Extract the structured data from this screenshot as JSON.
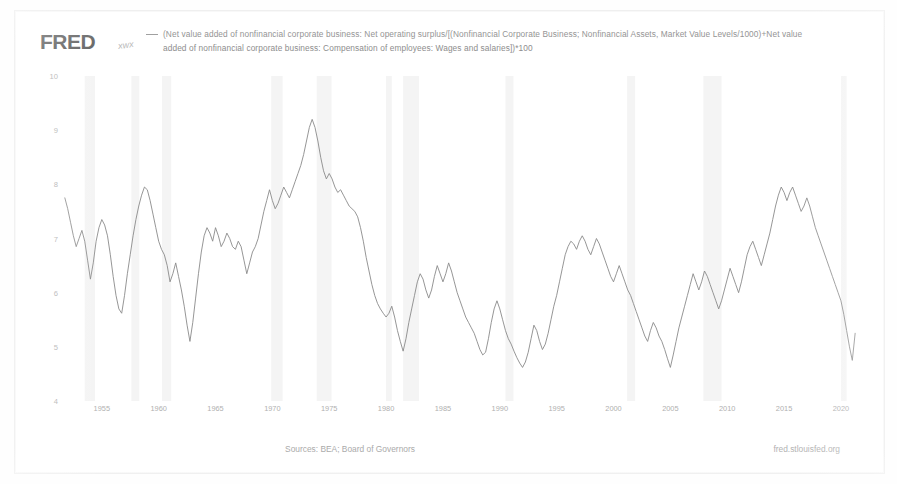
{
  "header": {
    "logo": "FRED",
    "logo_mark": "icon",
    "legend_text": "(Net value added of nonfinancial corporate business: Net operating surplus/[(Nonfinancial Corporate Business; Nonfinancial Assets, Market Value Levels/1000)+Net value added of nonfinancial corporate business: Compensation of employees: Wages and salaries])*100"
  },
  "footer": {
    "sources": "Sources: BEA; Board of Governors",
    "url": "fred.stlouisfed.org"
  },
  "style": {
    "line_color": "#8a8a8a",
    "recession_color": "#f4f4f4",
    "tick_color": "#b0b0b0",
    "text_color": "#8d8d8d",
    "background": "#ffffff"
  },
  "chart_data": {
    "type": "line",
    "title": "",
    "subtitle": "",
    "xlabel": "",
    "ylabel": "",
    "xlim": [
      1951.5,
      2021.5
    ],
    "ylim": [
      4,
      10
    ],
    "yticks": [
      4,
      5,
      6,
      7,
      8,
      9,
      10
    ],
    "xticks": [
      1955,
      1960,
      1965,
      1970,
      1975,
      1980,
      1985,
      1990,
      1995,
      2000,
      2005,
      2010,
      2015,
      2020
    ],
    "xtick_labels": [
      "1955",
      "1960",
      "1965",
      "1970",
      "1975",
      "1980",
      "1985",
      "1990",
      "1995",
      "2000",
      "2005",
      "2010",
      "2015",
      "2020"
    ],
    "ytick_labels": [
      "4",
      "5",
      "6",
      "7",
      "8",
      "9",
      "10"
    ],
    "grid": false,
    "legend_position": "top",
    "series": [
      {
        "name": "(Net value added of nonfinancial corporate business: Net operating surplus/[(Nonfinancial Corporate Business; Nonfinancial Assets, Market Value Levels/1000)+Net value added of nonfinancial corporate business: Compensation of employees: Wages and salaries])*100",
        "color": "#8a8a8a",
        "x": [
          1951.75,
          1952.0,
          1952.25,
          1952.5,
          1952.75,
          1953.0,
          1953.25,
          1953.5,
          1953.75,
          1954.0,
          1954.25,
          1954.5,
          1954.75,
          1955.0,
          1955.25,
          1955.5,
          1955.75,
          1956.0,
          1956.25,
          1956.5,
          1956.75,
          1957.0,
          1957.25,
          1957.5,
          1957.75,
          1958.0,
          1958.25,
          1958.5,
          1958.75,
          1959.0,
          1959.25,
          1959.5,
          1959.75,
          1960.0,
          1960.25,
          1960.5,
          1960.75,
          1961.0,
          1961.25,
          1961.5,
          1961.75,
          1962.0,
          1962.25,
          1962.5,
          1962.75,
          1963.0,
          1963.25,
          1963.5,
          1963.75,
          1964.0,
          1964.25,
          1964.5,
          1964.75,
          1965.0,
          1965.25,
          1965.5,
          1965.75,
          1966.0,
          1966.25,
          1966.5,
          1966.75,
          1967.0,
          1967.25,
          1967.5,
          1967.75,
          1968.0,
          1968.25,
          1968.5,
          1968.75,
          1969.0,
          1969.25,
          1969.5,
          1969.75,
          1970.0,
          1970.25,
          1970.5,
          1970.75,
          1971.0,
          1971.25,
          1971.5,
          1971.75,
          1972.0,
          1972.25,
          1972.5,
          1972.75,
          1973.0,
          1973.25,
          1973.5,
          1973.75,
          1974.0,
          1974.25,
          1974.5,
          1974.75,
          1975.0,
          1975.25,
          1975.5,
          1975.75,
          1976.0,
          1976.25,
          1976.5,
          1976.75,
          1977.0,
          1977.25,
          1977.5,
          1977.75,
          1978.0,
          1978.25,
          1978.5,
          1978.75,
          1979.0,
          1979.25,
          1979.5,
          1979.75,
          1980.0,
          1980.25,
          1980.5,
          1980.75,
          1981.0,
          1981.25,
          1981.5,
          1981.75,
          1982.0,
          1982.25,
          1982.5,
          1982.75,
          1983.0,
          1983.25,
          1983.5,
          1983.75,
          1984.0,
          1984.25,
          1984.5,
          1984.75,
          1985.0,
          1985.25,
          1985.5,
          1985.75,
          1986.0,
          1986.25,
          1986.5,
          1986.75,
          1987.0,
          1987.25,
          1987.5,
          1987.75,
          1988.0,
          1988.25,
          1988.5,
          1988.75,
          1989.0,
          1989.25,
          1989.5,
          1989.75,
          1990.0,
          1990.25,
          1990.5,
          1990.75,
          1991.0,
          1991.25,
          1991.5,
          1991.75,
          1992.0,
          1992.25,
          1992.5,
          1992.75,
          1993.0,
          1993.25,
          1993.5,
          1993.75,
          1994.0,
          1994.25,
          1994.5,
          1994.75,
          1995.0,
          1995.25,
          1995.5,
          1995.75,
          1996.0,
          1996.25,
          1996.5,
          1996.75,
          1997.0,
          1997.25,
          1997.5,
          1997.75,
          1998.0,
          1998.25,
          1998.5,
          1998.75,
          1999.0,
          1999.25,
          1999.5,
          1999.75,
          2000.0,
          2000.25,
          2000.5,
          2000.75,
          2001.0,
          2001.25,
          2001.5,
          2001.75,
          2002.0,
          2002.25,
          2002.5,
          2002.75,
          2003.0,
          2003.25,
          2003.5,
          2003.75,
          2004.0,
          2004.25,
          2004.5,
          2004.75,
          2005.0,
          2005.25,
          2005.5,
          2005.75,
          2006.0,
          2006.25,
          2006.5,
          2006.75,
          2007.0,
          2007.25,
          2007.5,
          2007.75,
          2008.0,
          2008.25,
          2008.5,
          2008.75,
          2009.0,
          2009.25,
          2009.5,
          2009.75,
          2010.0,
          2010.25,
          2010.5,
          2010.75,
          2011.0,
          2011.25,
          2011.5,
          2011.75,
          2012.0,
          2012.25,
          2012.5,
          2012.75,
          2013.0,
          2013.25,
          2013.5,
          2013.75,
          2014.0,
          2014.25,
          2014.5,
          2014.75,
          2015.0,
          2015.25,
          2015.5,
          2015.75,
          2016.0,
          2016.25,
          2016.5,
          2016.75,
          2017.0,
          2017.25,
          2017.5,
          2017.75,
          2018.0,
          2018.25,
          2018.5,
          2018.75,
          2019.0,
          2019.25,
          2019.5,
          2019.75,
          2020.0,
          2020.25,
          2020.5,
          2020.75,
          2021.0,
          2021.25
        ],
        "values": [
          7.75,
          7.55,
          7.3,
          7.05,
          6.85,
          7.0,
          7.15,
          6.95,
          6.6,
          6.25,
          6.55,
          6.95,
          7.2,
          7.35,
          7.25,
          7.05,
          6.7,
          6.3,
          5.95,
          5.7,
          5.62,
          5.95,
          6.35,
          6.7,
          7.05,
          7.35,
          7.6,
          7.8,
          7.95,
          7.9,
          7.7,
          7.45,
          7.2,
          6.95,
          6.8,
          6.7,
          6.5,
          6.2,
          6.35,
          6.55,
          6.3,
          6.05,
          5.75,
          5.4,
          5.1,
          5.45,
          5.9,
          6.35,
          6.75,
          7.05,
          7.2,
          7.1,
          6.95,
          7.2,
          7.05,
          6.85,
          6.95,
          7.1,
          7.0,
          6.85,
          6.8,
          6.95,
          6.85,
          6.6,
          6.35,
          6.55,
          6.75,
          6.85,
          7.0,
          7.25,
          7.5,
          7.7,
          7.9,
          7.7,
          7.55,
          7.65,
          7.8,
          7.95,
          7.85,
          7.75,
          7.9,
          8.05,
          8.2,
          8.35,
          8.55,
          8.8,
          9.05,
          9.2,
          9.05,
          8.8,
          8.5,
          8.25,
          8.1,
          8.2,
          8.1,
          7.95,
          7.85,
          7.9,
          7.8,
          7.7,
          7.6,
          7.55,
          7.5,
          7.4,
          7.2,
          6.95,
          6.65,
          6.4,
          6.15,
          5.95,
          5.8,
          5.7,
          5.62,
          5.55,
          5.62,
          5.75,
          5.55,
          5.3,
          5.1,
          4.92,
          5.15,
          5.45,
          5.7,
          5.95,
          6.2,
          6.35,
          6.25,
          6.05,
          5.9,
          6.05,
          6.3,
          6.5,
          6.35,
          6.2,
          6.35,
          6.55,
          6.4,
          6.2,
          6.0,
          5.85,
          5.7,
          5.55,
          5.45,
          5.35,
          5.25,
          5.1,
          4.95,
          4.85,
          4.9,
          5.15,
          5.45,
          5.7,
          5.85,
          5.7,
          5.5,
          5.3,
          5.15,
          5.05,
          4.92,
          4.8,
          4.7,
          4.62,
          4.72,
          4.9,
          5.15,
          5.4,
          5.3,
          5.1,
          4.95,
          5.05,
          5.25,
          5.5,
          5.75,
          5.95,
          6.2,
          6.45,
          6.7,
          6.85,
          6.95,
          6.9,
          6.8,
          6.95,
          7.05,
          6.95,
          6.8,
          6.7,
          6.85,
          7.0,
          6.9,
          6.75,
          6.6,
          6.45,
          6.3,
          6.2,
          6.35,
          6.5,
          6.35,
          6.2,
          6.05,
          5.95,
          5.8,
          5.65,
          5.5,
          5.35,
          5.2,
          5.1,
          5.3,
          5.45,
          5.35,
          5.2,
          5.1,
          4.95,
          4.78,
          4.62,
          4.85,
          5.1,
          5.35,
          5.55,
          5.75,
          5.95,
          6.15,
          6.35,
          6.2,
          6.05,
          6.2,
          6.4,
          6.3,
          6.15,
          6.0,
          5.85,
          5.7,
          5.85,
          6.05,
          6.25,
          6.45,
          6.3,
          6.15,
          6.0,
          6.2,
          6.45,
          6.7,
          6.85,
          6.95,
          6.8,
          6.65,
          6.5,
          6.7,
          6.9,
          7.1,
          7.35,
          7.6,
          7.8,
          7.95,
          7.85,
          7.7,
          7.85,
          7.95,
          7.8,
          7.65,
          7.5,
          7.6,
          7.75,
          7.6,
          7.4,
          7.2,
          7.05,
          6.9,
          6.75,
          6.6,
          6.45,
          6.3,
          6.15,
          6.0,
          5.85,
          5.6,
          5.3,
          5.0,
          4.75,
          5.25
        ],
        "recession_bands": [
          [
            1953.5,
            1954.4
          ],
          [
            1957.6,
            1958.3
          ],
          [
            1960.3,
            1961.1
          ],
          [
            1969.9,
            1970.9
          ],
          [
            1973.9,
            1975.2
          ],
          [
            1980.0,
            1980.5
          ],
          [
            1981.5,
            1982.9
          ],
          [
            1990.5,
            1991.2
          ],
          [
            2001.2,
            2001.9
          ],
          [
            2007.9,
            2009.5
          ],
          [
            2020.0,
            2020.5
          ]
        ]
      }
    ]
  }
}
